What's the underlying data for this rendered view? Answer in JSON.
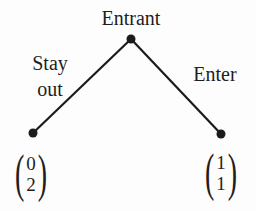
{
  "diagram": {
    "root": {
      "label": "Entrant"
    },
    "branches": {
      "left": {
        "label_line1": "Stay",
        "label_line2": "out"
      },
      "right": {
        "label": "Enter"
      }
    },
    "payoffs": {
      "left": {
        "open": "(",
        "top": "0",
        "bottom": "2",
        "close": ")"
      },
      "right": {
        "open": "(",
        "top": "1",
        "bottom": "1",
        "close": ")"
      }
    },
    "colors": {
      "background": "#fdfdfd",
      "line": "#1b1b1b",
      "text": "#1e1e1e"
    }
  }
}
